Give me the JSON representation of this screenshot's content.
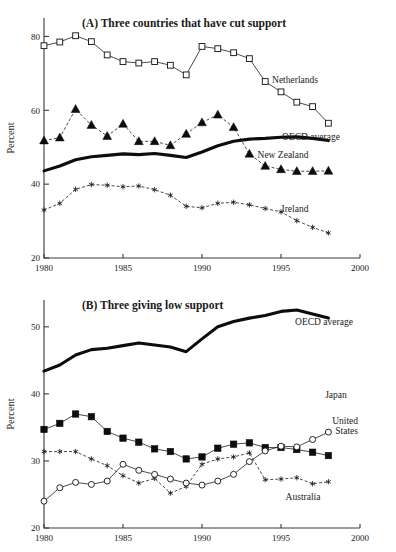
{
  "figure": {
    "ylabel": "Percent",
    "xlabels": [
      "1980",
      "1985",
      "1990",
      "1995",
      "2000"
    ]
  },
  "chart_data": [
    {
      "type": "line",
      "title": "(A) Three countries that have cut support",
      "xlabel": "",
      "ylabel": "Percent",
      "xlim": [
        1980,
        2000
      ],
      "ylim": [
        20,
        85
      ],
      "yticks": [
        20,
        40,
        60,
        80
      ],
      "xticks": [
        1980,
        1985,
        1990,
        1995,
        2000
      ],
      "grid": false,
      "legend_position": "inline-right",
      "x": [
        1980,
        1981,
        1982,
        1983,
        1984,
        1985,
        1986,
        1987,
        1988,
        1989,
        1990,
        1991,
        1992,
        1993,
        1994,
        1995,
        1996,
        1997,
        1998
      ],
      "series": [
        {
          "name": "Netherlands",
          "marker": "open-square",
          "values": [
            77.5,
            78.5,
            80.2,
            78.6,
            75.0,
            73.2,
            72.8,
            73.2,
            72.2,
            69.6,
            77.3,
            76.7,
            75.6,
            74.0,
            67.8,
            65.0,
            62.2,
            61.0,
            56.5
          ]
        },
        {
          "name": "New Zealand",
          "marker": "filled-triangle",
          "values": [
            51.8,
            52.6,
            60.3,
            56.0,
            53.0,
            56.3,
            51.6,
            51.6,
            50.5,
            53.6,
            56.7,
            58.8,
            55.4,
            48.2,
            44.9,
            44.0,
            43.5,
            43.5,
            43.6
          ]
        },
        {
          "name": "OECD average",
          "marker": "thick-line",
          "values": [
            43.6,
            44.9,
            46.6,
            47.4,
            47.8,
            48.2,
            48.0,
            48.3,
            47.8,
            47.2,
            48.7,
            50.4,
            51.6,
            52.2,
            52.4,
            52.7,
            52.8,
            52.4,
            51.8
          ]
        },
        {
          "name": "Ireland",
          "marker": "asterisk",
          "values": [
            33.0,
            34.8,
            38.6,
            39.9,
            39.7,
            39.3,
            39.5,
            38.5,
            37.0,
            34.0,
            33.6,
            34.8,
            35.1,
            34.4,
            33.4,
            32.5,
            30.1,
            28.3,
            26.8
          ]
        }
      ]
    },
    {
      "type": "line",
      "title": "(B) Three giving low support",
      "xlabel": "",
      "ylabel": "Percent",
      "xlim": [
        1980,
        2000
      ],
      "ylim": [
        20,
        54
      ],
      "yticks": [
        20,
        30,
        40,
        50
      ],
      "xticks": [
        1980,
        1985,
        1990,
        1995,
        2000
      ],
      "grid": false,
      "legend_position": "inline-right",
      "x": [
        1980,
        1981,
        1982,
        1983,
        1984,
        1985,
        1986,
        1987,
        1988,
        1989,
        1990,
        1991,
        1992,
        1993,
        1994,
        1995,
        1996,
        1997,
        1998
      ],
      "series": [
        {
          "name": "OECD average",
          "marker": "thick-line",
          "values": [
            43.4,
            44.3,
            45.8,
            46.6,
            46.8,
            47.2,
            47.6,
            47.3,
            47.0,
            46.3,
            48.2,
            50.0,
            50.8,
            51.3,
            51.7,
            52.3,
            52.5,
            51.9,
            51.3
          ]
        },
        {
          "name": "United States",
          "marker": "filled-square",
          "values": [
            34.7,
            35.6,
            37.0,
            36.6,
            34.4,
            33.4,
            32.8,
            31.8,
            31.4,
            30.3,
            30.6,
            31.9,
            32.5,
            32.7,
            32.0,
            32.0,
            31.7,
            31.3,
            30.8
          ]
        },
        {
          "name": "Australia",
          "marker": "asterisk",
          "values": [
            31.4,
            31.4,
            31.4,
            30.3,
            29.3,
            27.8,
            26.7,
            27.4,
            25.2,
            26.2,
            29.5,
            30.3,
            30.6,
            31.2,
            27.2,
            27.3,
            27.5,
            26.6,
            26.9
          ]
        },
        {
          "name": "Japan",
          "marker": "open-circle",
          "values": [
            24.0,
            26.0,
            26.8,
            26.5,
            27.0,
            29.5,
            28.6,
            28.0,
            27.3,
            26.7,
            26.4,
            27.0,
            28.0,
            29.9,
            31.5,
            32.2,
            32.1,
            33.2,
            34.3
          ]
        }
      ]
    }
  ]
}
